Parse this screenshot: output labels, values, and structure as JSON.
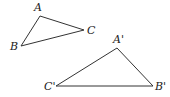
{
  "diagram": {
    "type": "geometry-figure",
    "triangles": [
      {
        "name": "ABC",
        "vertices": [
          {
            "label": "A",
            "x": 40,
            "y": 16,
            "lx": 34,
            "ly": 11
          },
          {
            "label": "B",
            "x": 21,
            "y": 46,
            "lx": 10,
            "ly": 50
          },
          {
            "label": "C",
            "x": 84,
            "y": 30,
            "lx": 87,
            "ly": 34
          }
        ]
      },
      {
        "name": "A'B'C'",
        "vertices": [
          {
            "label": "A'",
            "x": 117,
            "y": 48,
            "lx": 113,
            "ly": 43
          },
          {
            "label": "B'",
            "x": 153,
            "y": 86,
            "lx": 155,
            "ly": 90
          },
          {
            "label": "C'",
            "x": 56,
            "y": 86,
            "lx": 44,
            "ly": 90
          }
        ]
      }
    ],
    "colors": {
      "stroke": "#333333",
      "text": "#222222",
      "background": "#ffffff"
    }
  }
}
